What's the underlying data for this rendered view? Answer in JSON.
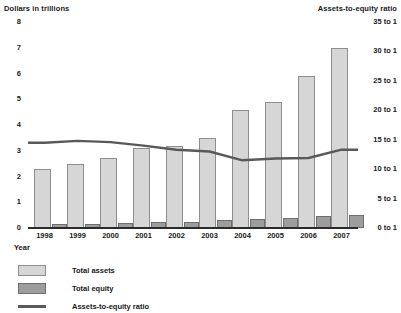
{
  "chart_data": {
    "type": "bar",
    "title": "",
    "subtitle": "",
    "xlabel": "Year",
    "ylabel": "Dollars in trillions",
    "y2label": "Assets-to-equity ratio",
    "categories": [
      "1998",
      "1999",
      "2000",
      "2001",
      "2002",
      "2003",
      "2004",
      "2005",
      "2006",
      "2007"
    ],
    "ylim": [
      0,
      8
    ],
    "y2lim": [
      0,
      35
    ],
    "yticks": [
      "8",
      "7",
      "6",
      "5",
      "4",
      "3",
      "2",
      "1",
      "0"
    ],
    "ytick_values": [
      8,
      7,
      6,
      5,
      4,
      3,
      2,
      1,
      0
    ],
    "y2ticks": [
      "35 to 1",
      "30 to 1",
      "25 to 1",
      "20 to 1",
      "15 to 1",
      "10 to 1",
      "5 to 1",
      "0 to 1"
    ],
    "y2tick_values": [
      35,
      30,
      25,
      20,
      15,
      10,
      5,
      0
    ],
    "grid": false,
    "legend_position": "bottom-left",
    "series": [
      {
        "name": "Total assets",
        "type": "bar",
        "axis": "left",
        "color": "#d6d6d6",
        "values": [
          2.3,
          2.5,
          2.7,
          3.1,
          3.2,
          3.5,
          4.6,
          4.9,
          5.9,
          7.0
        ]
      },
      {
        "name": "Total equity",
        "type": "bar",
        "axis": "left",
        "color": "#9d9d9d",
        "values": [
          0.15,
          0.17,
          0.2,
          0.22,
          0.25,
          0.3,
          0.35,
          0.4,
          0.47,
          0.5
        ]
      },
      {
        "name": "Assets-to-equity ratio",
        "type": "line",
        "axis": "right",
        "color": "#595959",
        "values": [
          14.5,
          14.8,
          14.6,
          14.0,
          13.3,
          13.0,
          11.5,
          11.8,
          11.9,
          13.3
        ]
      }
    ]
  },
  "legend": {
    "items": [
      {
        "label": "Total assets",
        "swatch": "assets"
      },
      {
        "label": "Total equity",
        "swatch": "equity"
      },
      {
        "label": "Assets-to-equity ratio",
        "swatch": "line"
      }
    ]
  }
}
